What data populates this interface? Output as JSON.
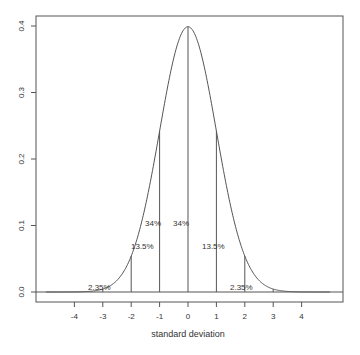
{
  "chart_data": {
    "type": "line",
    "title": "",
    "xlabel": "standard deviation",
    "ylabel": "",
    "xlim": [
      -5.0,
      5.5
    ],
    "ylim": [
      -0.015,
      0.415
    ],
    "x_ticks": [
      -4,
      -3,
      -2,
      -1,
      0,
      1,
      2,
      3,
      4
    ],
    "x_tick_labels": [
      "-4",
      "-3",
      "-2",
      "-1",
      "0",
      "1",
      "2",
      "3",
      "4"
    ],
    "y_ticks": [
      0.0,
      0.1,
      0.2,
      0.3,
      0.4
    ],
    "y_tick_labels": [
      "0.0",
      "0.1",
      "0.2",
      "0.3",
      "0.4"
    ],
    "grid": false,
    "legend": null,
    "series": [
      {
        "name": "standard normal density",
        "function": "dnorm(x)",
        "x_range": [
          -5,
          5
        ],
        "peak": 0.3989
      }
    ],
    "vertical_lines_at": [
      -3,
      -2,
      -1,
      0,
      1,
      2,
      3
    ],
    "baseline_y": 0,
    "annotations": [
      {
        "text": "2.35%",
        "x": -2.5,
        "y": 0.0
      },
      {
        "text": "13.5%",
        "x": -1.5,
        "y": 0.05
      },
      {
        "text": "34%",
        "x": -0.5,
        "y": 0.11
      },
      {
        "text": "34%",
        "x": 0.5,
        "y": 0.11
      },
      {
        "text": "13.5%",
        "x": 1.5,
        "y": 0.05
      },
      {
        "text": "2.35%",
        "x": 2.5,
        "y": 0.0
      }
    ]
  },
  "colors": {
    "line": "#555555",
    "axis": "#555555",
    "text": "#333333",
    "background": "#ffffff"
  }
}
